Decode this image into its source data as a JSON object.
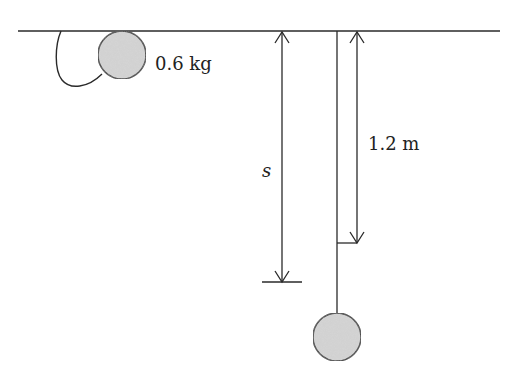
{
  "diagram": {
    "mass_label": "0.6 kg",
    "drop_label": "1.2 m",
    "distance_label": "s",
    "colors": {
      "line": "#2a2a2a",
      "ball_fill": "#d6d6d6",
      "background": "#ffffff"
    },
    "elements": {
      "ceiling": "horizontal support line",
      "ball_initial": "ball held at ceiling with slack string loop",
      "ball_final": "ball hanging at end of taut string",
      "arrow_s": "distance s from ceiling to lowest point",
      "arrow_drop": "1.2 m string length"
    }
  }
}
